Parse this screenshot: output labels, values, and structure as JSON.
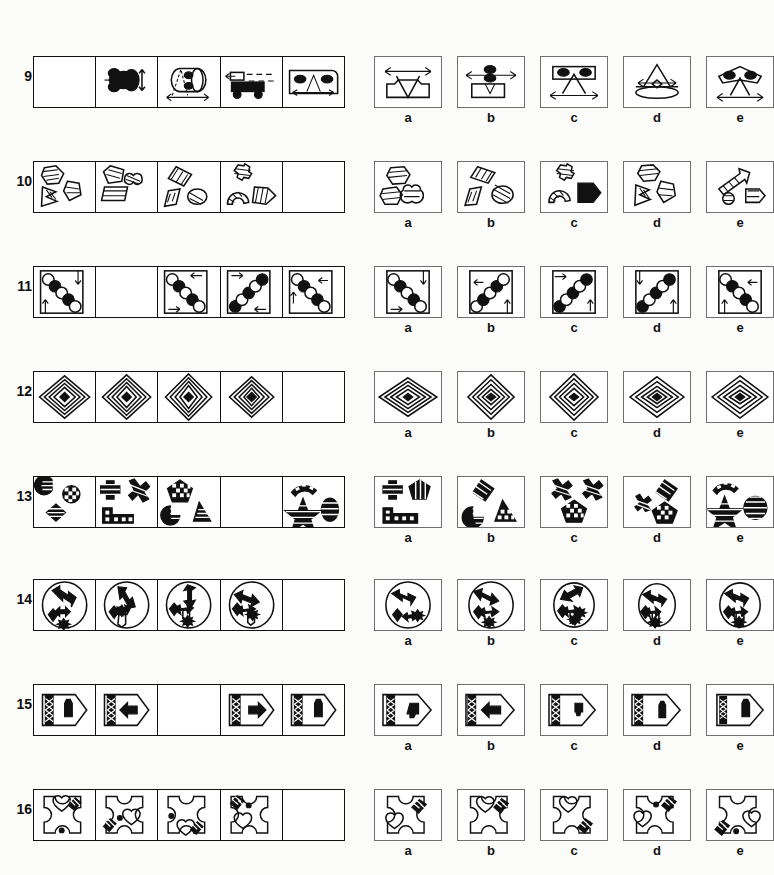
{
  "page": {
    "background_color": "#fbfbf9",
    "ink_color": "#111111",
    "option_border_color": "#6f6f6f",
    "option_labels": [
      "a",
      "b",
      "c",
      "d",
      "e"
    ]
  },
  "rows": [
    {
      "number": "9",
      "blank_cell_index": 0,
      "cells": [
        {
          "name": "blank-cell",
          "description": "empty cell"
        },
        {
          "name": "black-blob-double-arrow",
          "description": "solid black blob shapes with small vertical double arrow"
        },
        {
          "name": "cylinder-with-dots-and-arrow",
          "description": "cylinder containing two black ovals, dashed triangle, horizontal double arrow"
        },
        {
          "name": "truck-with-dashes",
          "description": "flatbed truck with dashed motion lines"
        },
        {
          "name": "rounded-box-dots-triangle",
          "description": "rounded rectangle with two black ovals, triangle and double arrow"
        }
      ],
      "options": [
        {
          "label": "a",
          "description": "rectangle with notched top, inverted triangle, double arrow above"
        },
        {
          "label": "b",
          "description": "rectangle with two black ovals, double arrow, small v"
        },
        {
          "label": "c",
          "description": "rectangle with two black ovals, triangle, double arrow below"
        },
        {
          "label": "d",
          "description": "ellipse base with tall triangle and double arrow"
        },
        {
          "label": "e",
          "description": "winged shape with two black ovals, triangle, double arrow"
        }
      ]
    },
    {
      "number": "10",
      "blank_cell_index": 4,
      "cells": [
        {
          "name": "hexagon-chevron-shield",
          "description": "hatched hexagon, striped chevron, hatched shield"
        },
        {
          "name": "pentagon-heart-trapezoid",
          "description": "hatched pentagon, striped heart, hatched trapezoid"
        },
        {
          "name": "rhombus-parallelogram-ellipse",
          "description": "striped rhombus, hatched parallelogram, hatched ellipse"
        },
        {
          "name": "cross-arch-chevron",
          "description": "hatched cross, hatched arch, striped chevron"
        },
        {
          "name": "blank-cell",
          "description": "empty cell"
        }
      ],
      "options": [
        {
          "label": "a",
          "description": "hatched hexagon, hatched pentagon-ish shape, striped heart"
        },
        {
          "label": "b",
          "description": "striped rhombus, hatched parallelogram, cross-hatched ellipse"
        },
        {
          "label": "c",
          "description": "hatched cross, hatched arch, striped pentagon-arrow"
        },
        {
          "label": "d",
          "description": "hatched hexagon, striped chevron, hatched shield"
        },
        {
          "label": "e",
          "description": "striped arrow, small circle, hatched arrow-pentagon"
        }
      ]
    },
    {
      "number": "11",
      "blank_cell_index": 1,
      "cells": [
        {
          "name": "diagonal-circles-arrows-a",
          "description": "square frame, diagonal chain of 5 alternating black/white circles, two arrows"
        },
        {
          "name": "blank-cell",
          "description": "empty cell"
        },
        {
          "name": "diagonal-circles-arrows-b",
          "description": "square frame, diagonal chain of circles, two arrows"
        },
        {
          "name": "diagonal-circles-arrows-c",
          "description": "square frame, diagonal chain of circles, two arrows"
        },
        {
          "name": "diagonal-circles-arrows-d",
          "description": "square frame, diagonal chain of circles, two arrows"
        }
      ],
      "options": [
        {
          "label": "a",
          "description": "chain down-right, arrow top-right down, arrow bottom-left right"
        },
        {
          "label": "b",
          "description": "chain up-right, arrow left, arrow up"
        },
        {
          "label": "c",
          "description": "chain up-right, arrow top-left right, arrow bottom-right up"
        },
        {
          "label": "d",
          "description": "chain up-right, arrow top-left down, arrow bottom-right up"
        },
        {
          "label": "e",
          "description": "chain down-right, arrow right, arrow up"
        }
      ]
    },
    {
      "number": "12",
      "blank_cell_index": 4,
      "cells": [
        {
          "name": "concentric-diamonds-5",
          "description": "nested diamond outlines with solid black centre diamond"
        },
        {
          "name": "concentric-diamonds-5",
          "description": "nested diamond outlines with solid black centre diamond"
        },
        {
          "name": "concentric-diamonds-5",
          "description": "nested diamond outlines with solid black centre diamond"
        },
        {
          "name": "concentric-diamonds-5",
          "description": "nested diamond outlines with solid black centre diamond"
        },
        {
          "name": "blank-cell",
          "description": "empty cell"
        }
      ],
      "options": [
        {
          "label": "a",
          "description": "nested diamonds, wide"
        },
        {
          "label": "b",
          "description": "nested diamonds, tall"
        },
        {
          "label": "c",
          "description": "nested diamonds, tall"
        },
        {
          "label": "d",
          "description": "nested diamonds, wide"
        },
        {
          "label": "e",
          "description": "nested diamonds, wide"
        }
      ]
    },
    {
      "number": "13",
      "blank_cell_index": 3,
      "cells": [
        {
          "name": "pacman-checker-diamond",
          "description": "striped pac-man, checkered circle, striped diamond"
        },
        {
          "name": "cross-x-bar",
          "description": "striped cross, striped X, checkered bar"
        },
        {
          "name": "pentagon-pacman-triangle",
          "description": "checkered pentagon, striped pac-man, striped triangle"
        },
        {
          "name": "blank-cell",
          "description": "empty cell"
        },
        {
          "name": "arc-star-ellipse",
          "description": "checkered arc, striped star, striped ellipse"
        }
      ],
      "options": [
        {
          "label": "a",
          "description": "striped cross, striped pentagon, checkered bar"
        },
        {
          "label": "b",
          "description": "striped rhombus, striped pac-man, checkered triangle"
        },
        {
          "label": "c",
          "description": "two striped X shapes, checkered pentagon"
        },
        {
          "label": "d",
          "description": "striped X, striped rhombus, checkered pentagon"
        },
        {
          "label": "e",
          "description": "checkered arc, striped star, striped circle"
        }
      ]
    },
    {
      "number": "14",
      "blank_cell_index": 4,
      "cells": [
        {
          "name": "circle-zigzag-arrows-a",
          "description": "circle with zigzag double arrow and lower arrow cluster with asterisk"
        },
        {
          "name": "circle-zigzag-arrows-b",
          "description": "circle with rotated zigzag double arrow and lower arrow cluster"
        },
        {
          "name": "circle-zigzag-arrows-c",
          "description": "circle with vertical zigzag double arrow and lower arrow cluster"
        },
        {
          "name": "circle-zigzag-arrows-d",
          "description": "circle with tilted zigzag double arrow and lower arrow cluster"
        },
        {
          "name": "blank-cell",
          "description": "empty cell"
        }
      ],
      "options": [
        {
          "label": "a",
          "description": "circle, horizontal zigzag arrow, lower cluster with asterisk right"
        },
        {
          "label": "b",
          "description": "circle, tilted zigzag arrow, lower cluster asterisk below"
        },
        {
          "label": "c",
          "description": "circle, diagonal zigzag arrow, lower cluster with two asterisks"
        },
        {
          "label": "d",
          "description": "circle, horizontal zigzag arrow, lower cluster asterisk below"
        },
        {
          "label": "e",
          "description": "circle, horizontal zigzag arrow, lower cluster with asterisk"
        }
      ]
    },
    {
      "number": "15",
      "blank_cell_index": 2,
      "cells": [
        {
          "name": "tag-braid-flask",
          "description": "pentagon tag with braided band and black flask"
        },
        {
          "name": "tag-braid-left-arrow",
          "description": "pentagon tag with braided band and black left arrow"
        },
        {
          "name": "blank-cell",
          "description": "empty cell"
        },
        {
          "name": "tag-braid-right-arrow",
          "description": "pentagon tag with braided band and black right arrow"
        },
        {
          "name": "tag-braid-flask-2",
          "description": "pentagon tag with braided band and black flask"
        }
      ],
      "options": [
        {
          "label": "a",
          "description": "tag with braid, black inverted flask, wide tag"
        },
        {
          "label": "b",
          "description": "tag with braid, black left arrow"
        },
        {
          "label": "c",
          "description": "tag with braid, black small inverted flask"
        },
        {
          "label": "d",
          "description": "tag with braid, black upright flask"
        },
        {
          "label": "e",
          "description": "tag with braid, black upright flask, narrow braid"
        }
      ]
    },
    {
      "number": "16",
      "blank_cell_index": 4,
      "cells": [
        {
          "name": "octagon-heart-stripes-dot-a",
          "description": "cut-corner square with heart top, striped bar top-right, dot bottom"
        },
        {
          "name": "octagon-heart-stripes-dot-b",
          "description": "cut-corner square with striped bar bottom-left, dot, heart right"
        },
        {
          "name": "octagon-heart-stripes-dot-c",
          "description": "cut-corner square with dot left, heart and striped bar bottom"
        },
        {
          "name": "octagon-heart-stripes-dot-d",
          "description": "cut-corner square with striped bar top-left, dot, heart left"
        },
        {
          "name": "blank-cell",
          "description": "empty cell"
        }
      ],
      "options": [
        {
          "label": "a",
          "description": "cut-corner square, heart left, striped bar top-right"
        },
        {
          "label": "b",
          "description": "cut-corner square, heart top, striped bar top-right"
        },
        {
          "label": "c",
          "description": "cut-corner square, heart top, striped bar bottom-right"
        },
        {
          "label": "d",
          "description": "cut-corner square, heart left, dot centre, striped bar top-right"
        },
        {
          "label": "e",
          "description": "cut-corner square, striped bar bottom-left, dot, heart right"
        }
      ]
    }
  ]
}
